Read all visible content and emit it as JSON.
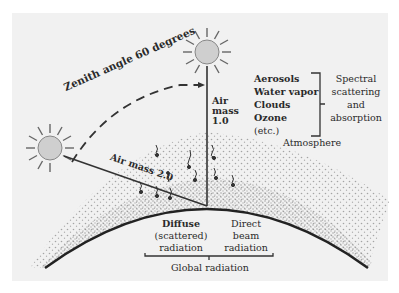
{
  "diagram": {
    "zenith_label": "Zenith angle 60 degrees",
    "air_mass_1": {
      "line1": "Air",
      "line2": "mass",
      "line3": "1.0"
    },
    "air_mass_2": "Air mass 2.0",
    "constituents": [
      "Aerosols",
      "Water vapor",
      "Clouds",
      "Ozone",
      "(etc.)"
    ],
    "effect": {
      "line1": "Spectral",
      "line2": "scattering",
      "line3": "and",
      "line4": "absorption"
    },
    "atmosphere_label": "Atmosphere",
    "diffuse": {
      "line1": "Diffuse",
      "line2": "(scattered)",
      "line3": "radiation"
    },
    "direct": {
      "line1": "Direct",
      "line2": "beam",
      "line3": "radiation"
    },
    "global_label": "Global radiation",
    "colors": {
      "panel": "#f1f1f1",
      "sun_fill": "#cfcfcf",
      "ink": "#2a2a2a",
      "dots": "#8a8a8a"
    }
  }
}
